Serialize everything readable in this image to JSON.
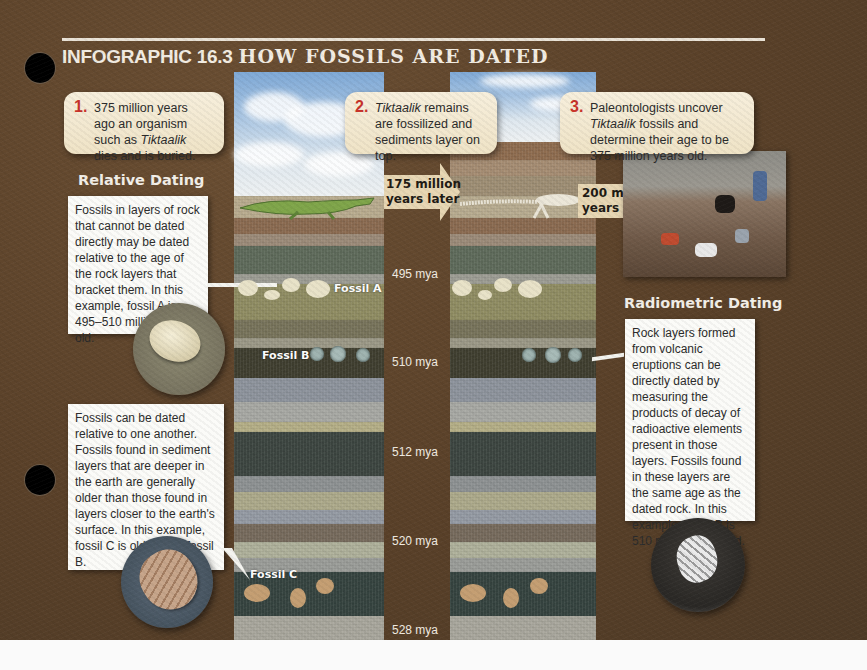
{
  "header": {
    "prefix": "INFOGRAPHIC 16.3",
    "title": "HOW FOSSILS ARE DATED"
  },
  "steps": [
    {
      "number": "1.",
      "text_before": "375 million years ago an organism such as ",
      "italic": "Tiktaalik",
      "text_after": " dies and is buried."
    },
    {
      "number": "2.",
      "text_before": "",
      "italic": "Tiktaalik",
      "text_after": " remains are fossilized and sediments layer on top."
    },
    {
      "number": "3.",
      "text_before": "Paleontologists uncover ",
      "italic": "Tiktaalik",
      "text_after": " fossils and determine their age to be 375 million years old."
    }
  ],
  "arrows": [
    {
      "line1": "175 million",
      "line2": "years later"
    },
    {
      "line1": "200 million",
      "line2": "years later"
    }
  ],
  "relative_dating": {
    "heading": "Relative Dating",
    "note1": "Fossils in layers of rock that cannot be dated directly may be dated relative to the age of the rock layers that bracket them. In this example, fossil A is 495–510 million years old.",
    "note2": "Fossils can be dated relative to one another. Fossils found in sediment layers that are deeper in the earth are generally older than those found in layers closer to the earth's surface. In this example, fossil C is older than fossil B."
  },
  "radiometric_dating": {
    "heading": "Radiometric Dating",
    "note": "Rock layers formed from volcanic eruptions can be directly dated by measuring the products of decay of radioactive elements present in those layers. Fossils found in these layers are the same age as the dated rock. In this example, fossil B is 510 million years old."
  },
  "fossils": {
    "a": "Fossil A",
    "b": "Fossil B",
    "c": "Fossil C"
  },
  "age_markers": [
    "495 mya",
    "510 mya",
    "512 mya",
    "520 mya",
    "528 mya"
  ],
  "colors": {
    "background": "#5a4129",
    "step_number": "#c8322a",
    "callout_bg": "#f3e8cf",
    "note_bg": "#fbfbf8",
    "arrow_fill": "#e7d6b3"
  }
}
